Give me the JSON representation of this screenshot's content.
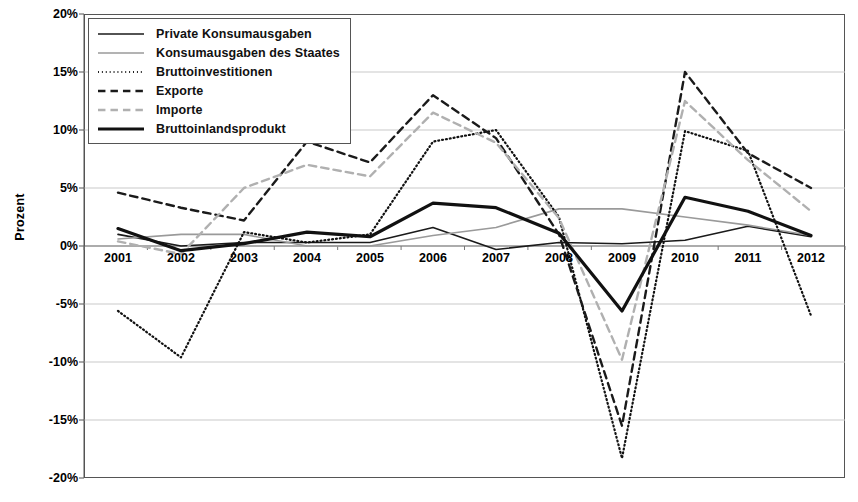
{
  "chart_data": {
    "type": "line",
    "title": "",
    "xlabel": "",
    "ylabel": "Prozent",
    "categories": [
      "2001",
      "2002",
      "2003",
      "2004",
      "2005",
      "2006",
      "2007",
      "2008",
      "2009",
      "2010",
      "2011",
      "2012"
    ],
    "ylim": [
      -20,
      20
    ],
    "ytick_labels": [
      "20%",
      "15%",
      "10%",
      "5%",
      "0%",
      "-5%",
      "-10%",
      "-15%",
      "-20%"
    ],
    "ytick_values": [
      20,
      15,
      10,
      5,
      0,
      -5,
      -10,
      -15,
      -20
    ],
    "ytick_suffix": "%",
    "grid": true,
    "legend_position": "top-left",
    "series": [
      {
        "name": "Private Konsumausgaben",
        "style": "solid",
        "width": 1.6,
        "color": "#1a1a1a",
        "values": [
          1.0,
          0.0,
          0.3,
          0.3,
          0.3,
          1.6,
          -0.3,
          0.3,
          0.2,
          0.5,
          1.7,
          0.8
        ]
      },
      {
        "name": "Konsumausgaben des Staates",
        "style": "solid",
        "width": 1.6,
        "color": "#9a9a9a",
        "values": [
          0.6,
          1.0,
          1.0,
          0.0,
          0.0,
          0.9,
          1.6,
          3.2,
          3.2,
          2.5,
          1.8,
          0.9
        ]
      },
      {
        "name": "Bruttoinvestitionen",
        "style": "dotted",
        "width": 2.2,
        "color": "#111111",
        "values": [
          -5.6,
          -9.6,
          1.2,
          0.3,
          1.0,
          9.0,
          10.0,
          2.5,
          -18.3,
          9.9,
          8.2,
          -6.0
        ]
      },
      {
        "name": "Exporte",
        "style": "dashed",
        "width": 2.4,
        "color": "#1a1a1a",
        "values": [
          4.6,
          3.3,
          2.2,
          9.0,
          7.2,
          13.0,
          9.3,
          1.0,
          -15.5,
          15.0,
          8.0,
          5.0
        ]
      },
      {
        "name": "Importe",
        "style": "dashed",
        "width": 2.4,
        "color": "#b0b0b0",
        "values": [
          0.4,
          -0.7,
          5.0,
          7.0,
          6.0,
          11.5,
          8.9,
          2.4,
          -9.8,
          12.5,
          7.4,
          3.0
        ]
      },
      {
        "name": "Bruttoinlandsprodukt",
        "style": "solid",
        "width": 3.2,
        "color": "#111111",
        "values": [
          1.5,
          -0.4,
          0.2,
          1.2,
          0.8,
          3.7,
          3.3,
          1.1,
          -5.6,
          4.2,
          3.0,
          0.9
        ]
      }
    ]
  },
  "legend": {
    "items": [
      {
        "label": "Private Konsumausgaben"
      },
      {
        "label": "Konsumausgaben des Staates"
      },
      {
        "label": "Bruttoinvestitionen"
      },
      {
        "label": "Exporte"
      },
      {
        "label": "Importe"
      },
      {
        "label": "Bruttoinlandsprodukt"
      }
    ]
  }
}
